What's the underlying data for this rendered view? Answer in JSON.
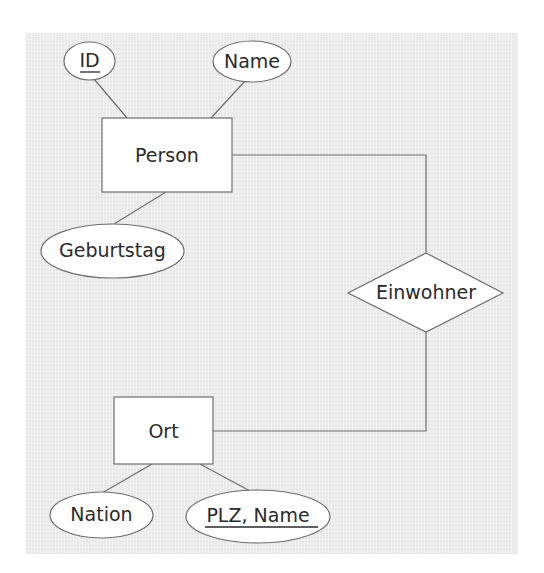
{
  "diagram": {
    "type": "er-diagram",
    "background_color": "#ebebeb",
    "stroke_color": "#6e6e6e",
    "entities": [
      {
        "id": "person",
        "label": "Person"
      },
      {
        "id": "ort",
        "label": "Ort"
      }
    ],
    "relationships": [
      {
        "id": "einwohner",
        "label": "Einwohner",
        "connects": [
          "person",
          "ort"
        ]
      }
    ],
    "attributes": [
      {
        "id": "person-id",
        "label": "ID",
        "entity": "person",
        "key": true
      },
      {
        "id": "person-name",
        "label": "Name",
        "entity": "person",
        "key": false
      },
      {
        "id": "person-geburtstag",
        "label": "Geburtstag",
        "entity": "person",
        "key": false
      },
      {
        "id": "ort-nation",
        "label": "Nation",
        "entity": "ort",
        "key": false
      },
      {
        "id": "ort-plz-name",
        "label": "PLZ, Name",
        "entity": "ort",
        "key": true
      }
    ]
  },
  "labels": {
    "person": "Person",
    "ort": "Ort",
    "einwohner": "Einwohner",
    "id": "ID",
    "name": "Name",
    "geburtstag": "Geburtstag",
    "nation": "Nation",
    "plz_name": "PLZ, Name"
  }
}
